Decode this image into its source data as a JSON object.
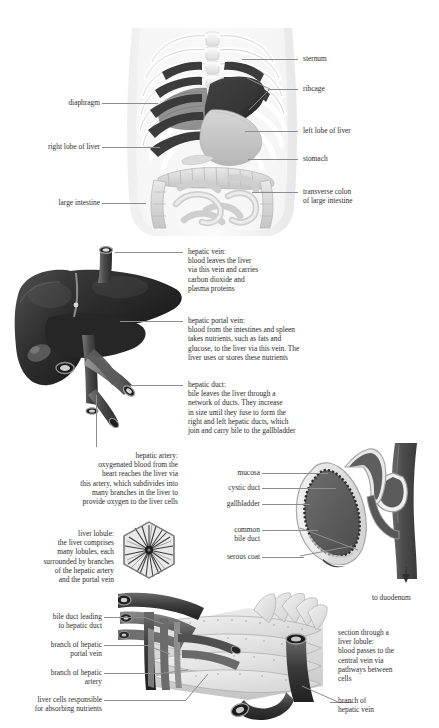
{
  "figure": {
    "background": "#ffffff",
    "leader_line_color": "#8d8d8d",
    "text_color": "#2b2b2b"
  },
  "panel_torso": {
    "name": "abdominal cavity overview",
    "labels_left": [
      {
        "id": "diaphragm",
        "text": "diaphragm"
      },
      {
        "id": "right-lobe-of-liver",
        "text": "right lobe of liver"
      },
      {
        "id": "large-intestine",
        "text": "large intestine"
      }
    ],
    "labels_right": [
      {
        "id": "sternum",
        "text": "sternum"
      },
      {
        "id": "ribcage",
        "text": "ribcage"
      },
      {
        "id": "left-lobe-of-liver",
        "text": "left lobe of liver"
      },
      {
        "id": "stomach",
        "text": "stomach"
      },
      {
        "id": "transverse-colon",
        "text": "transverse colon\nof large intestine"
      }
    ]
  },
  "panel_liver": {
    "name": "liver with vessels",
    "hepatic_vein": {
      "heading": "hepatic vein:",
      "body": "blood leaves the liver\nvia this vein and carries\ncarbon dioxide and\nplasma proteins"
    },
    "hepatic_portal_vein": {
      "heading": "hepatic portal vein:",
      "body": "blood from the intestines and spleen\ntakes nutrients, such as fats and\nglucose, to the liver via this vein. The\nliver uses or stores these nutrients"
    },
    "hepatic_duct": {
      "heading": "hepatic duct:",
      "body": "bile leaves the liver through a\nnetwork of ducts. They increase\nin size until they fuse to form the\nright and left hepatic ducts, which\njoin and carry bile to the gallbladder"
    },
    "hepatic_artery": {
      "heading": "hepatic artery:",
      "body": "oxygenated blood from the\nheart reaches the liver via\nthis artery, which subdivides into\nmany branches in the liver to\nprovide oxygen to the liver cells"
    },
    "liver_lobule": {
      "heading": "liver lobule:",
      "body": "the liver comprises\nmany lobules, each\nsurrounded by branches\nof the hepatic artery\nand the portal vein"
    }
  },
  "panel_gallbladder": {
    "name": "gallbladder cross-section",
    "labels": [
      {
        "id": "mucosa",
        "text": "mucosa"
      },
      {
        "id": "cystic-duct",
        "text": "cystic duct"
      },
      {
        "id": "gallbladder",
        "text": "gallbladder"
      },
      {
        "id": "common-bile-duct",
        "text": "common\nbile duct"
      },
      {
        "id": "serous-coat",
        "text": "serous coat"
      }
    ],
    "arrow_label": "to duodenum"
  },
  "panel_lobule": {
    "name": "liver lobule section",
    "labels_left": [
      {
        "id": "bile-duct-leading",
        "text": "bile duct leading\nto hepatic duct"
      },
      {
        "id": "branch-hepatic-portal-vein",
        "text": "branch of hepatic\nportal vein"
      },
      {
        "id": "branch-hepatic-artery",
        "text": "branch of hepatic\nartery"
      },
      {
        "id": "liver-cells",
        "text": "liver cells responsible\nfor absorbing nutrients"
      }
    ],
    "labels_right": [
      {
        "id": "section-through-lobule",
        "text": "section through a\nliver lobule:\nblood passes to the\ncentral vein via\npathways between\ncells"
      },
      {
        "id": "branch-hepatic-vein",
        "text": "branch of\nhepatic vein"
      }
    ]
  }
}
